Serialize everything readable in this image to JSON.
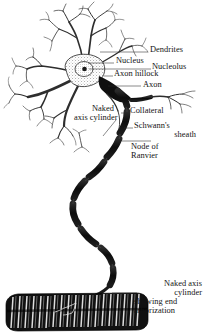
{
  "figure": {
    "background_color": "#ffffff",
    "ink_color": "#131313",
    "labels": [
      {
        "id": "dendrites",
        "text": "Dendrites",
        "x": 150,
        "y": 49
      },
      {
        "id": "nucleus",
        "text": "Nucleus",
        "x": 116,
        "y": 60
      },
      {
        "id": "nucleolus",
        "text": "Nucleolus",
        "x": 153,
        "y": 65
      },
      {
        "id": "axon_hillock",
        "text": "Axon hillock",
        "x": 114,
        "y": 72
      },
      {
        "id": "axon",
        "text": "Axon",
        "x": 143,
        "y": 83
      },
      {
        "id": "naked_axis_1",
        "text": "Naked",
        "x": 91,
        "y": 108
      },
      {
        "id": "naked_axis_2",
        "text": "axis cylinder",
        "x": 82,
        "y": 117
      },
      {
        "id": "collateral",
        "text": "Collateral",
        "x": 131,
        "y": 110
      },
      {
        "id": "schwanns",
        "text": "Schwann's",
        "x": 135,
        "y": 124
      },
      {
        "id": "sheath",
        "text": "sheath",
        "x": 153,
        "y": 133
      },
      {
        "id": "node_of",
        "text": "Node of",
        "x": 132,
        "y": 145
      },
      {
        "id": "ranvier",
        "text": "Ranvier",
        "x": 132,
        "y": 154
      },
      {
        "id": "end_arb_1",
        "text": "Naked axis",
        "x": 139,
        "y": 283
      },
      {
        "id": "end_arb_2",
        "text": "cylinder",
        "x": 155,
        "y": 292
      },
      {
        "id": "end_arb_3",
        "text": "showing end",
        "x": 135,
        "y": 301
      },
      {
        "id": "end_arb_4",
        "text": "arborization",
        "x": 135,
        "y": 310
      }
    ],
    "parts": {
      "soma": "cell-body",
      "dendrite_tree": "dendrites",
      "axon": "myelinated-axon",
      "collateral": "axon-collateral",
      "nodes": "nodes-of-ranvier",
      "end_plate": "motor-end-plate-striated-muscle"
    }
  }
}
